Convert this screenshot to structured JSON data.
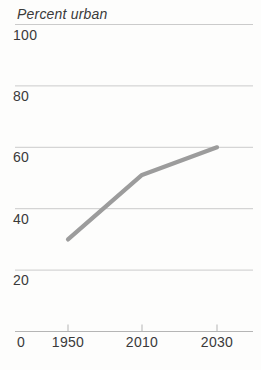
{
  "chart_data": {
    "type": "line",
    "title": "Percent urban",
    "categories": [
      "1950",
      "2010",
      "2030"
    ],
    "series": [
      {
        "name": "percent-urban",
        "values": [
          30,
          51,
          60
        ]
      }
    ],
    "y_ticks": [
      100,
      80,
      60,
      40,
      20
    ],
    "origin_label": "0",
    "ylim": [
      0,
      100
    ],
    "grid": true,
    "legend_position": "none",
    "xlabel": "",
    "ylabel": "",
    "colors": {
      "line": "#9c9c9c",
      "gridline": "#cbcbcb",
      "axis": "#b5b5b5",
      "text": "#3a3a3a",
      "background": "#fdfdfc"
    }
  }
}
